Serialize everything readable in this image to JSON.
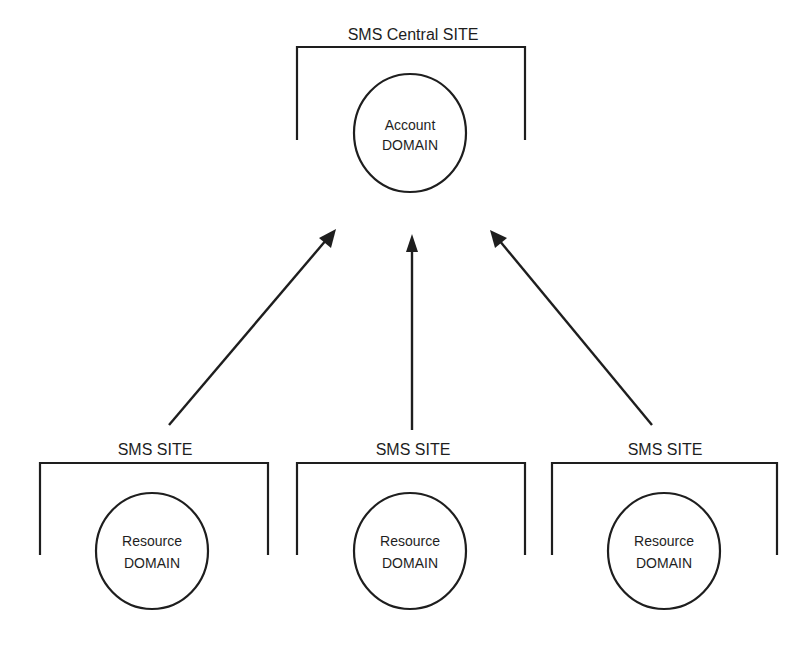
{
  "central": {
    "site_label": "SMS Central SITE",
    "domain_line1": "Account",
    "domain_line2": "DOMAIN"
  },
  "sites": [
    {
      "site_label": "SMS SITE",
      "domain_line1": "Resource",
      "domain_line2": "DOMAIN"
    },
    {
      "site_label": "SMS SITE",
      "domain_line1": "Resource",
      "domain_line2": "DOMAIN"
    },
    {
      "site_label": "SMS SITE",
      "domain_line1": "Resource",
      "domain_line2": "DOMAIN"
    }
  ],
  "edges": [
    {
      "from": "sites.0",
      "to": "central",
      "direction": "up"
    },
    {
      "from": "sites.1",
      "to": "central",
      "direction": "up"
    },
    {
      "from": "sites.2",
      "to": "central",
      "direction": "up"
    }
  ],
  "colors": {
    "stroke": "#1e1e1e",
    "background": "#ffffff"
  }
}
